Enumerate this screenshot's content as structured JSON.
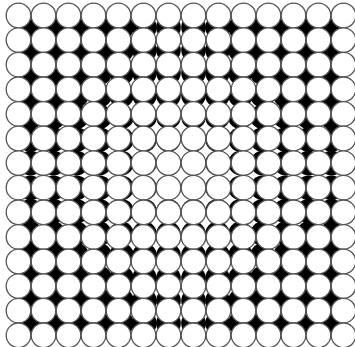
{
  "artwork": {
    "title": "",
    "grid": {
      "columns": 14,
      "rows": 14,
      "origin_x": 18.5,
      "origin_y": 15.5,
      "spacing_x": 25.0,
      "spacing_y": 24.6
    },
    "circle": {
      "radius": 12.3,
      "fill": "#ffffff",
      "stroke": "#555555",
      "stroke_width": 1.3
    },
    "shadow": {
      "radius": 12.3,
      "fill": "#000000",
      "offset_rule": "toward-center",
      "offsets_by_ring": [
        0,
        1,
        3,
        6,
        8,
        10,
        12
      ]
    },
    "background": "#ffffff"
  }
}
